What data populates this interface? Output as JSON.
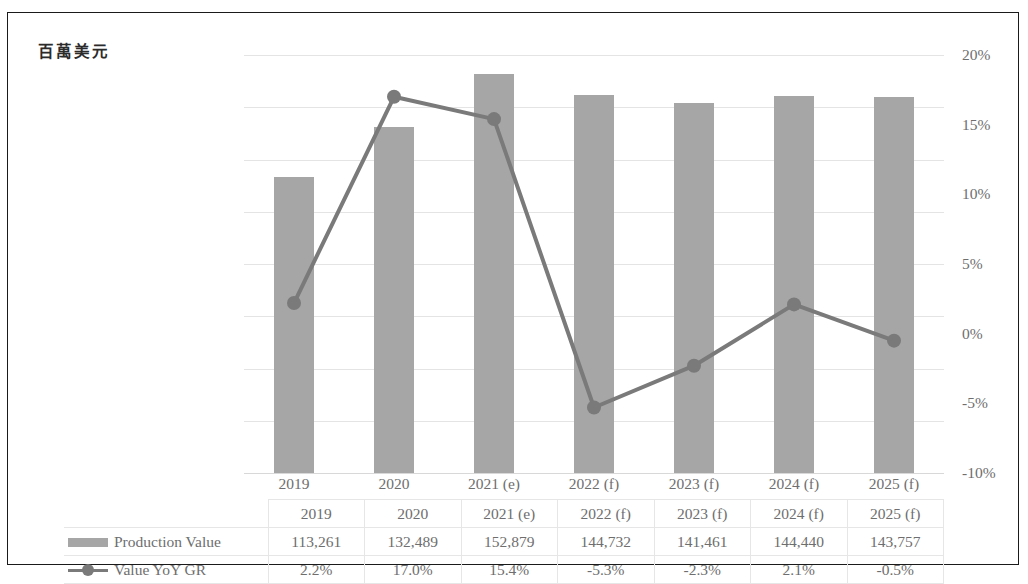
{
  "chart_data": {
    "type": "bar",
    "title": "百萬美元",
    "categories": [
      "2019",
      "2020",
      "2021 (e)",
      "2022 (f)",
      "2023 (f)",
      "2024 (f)",
      "2025 (f)"
    ],
    "series": [
      {
        "name": "Production Value",
        "type": "bar",
        "axis": "left",
        "color": "#a6a6a6",
        "values": [
          113261,
          132489,
          152879,
          144732,
          141461,
          144440,
          143757
        ],
        "labels": [
          "113,261",
          "132,489",
          "152,879",
          "144,732",
          "141,461",
          "144,440",
          "143,757"
        ]
      },
      {
        "name": "Value YoY GR",
        "type": "line",
        "axis": "right",
        "color": "#7a7a7a",
        "values": [
          2.2,
          17.0,
          15.4,
          -5.3,
          -2.3,
          2.1,
          -0.5
        ],
        "labels": [
          "2.2%",
          "17.0%",
          "15.4%",
          "-5.3%",
          "-2.3%",
          "2.1%",
          "-0.5%"
        ]
      }
    ],
    "xlabel": "",
    "ylabel": "百萬美元",
    "ylim": [
      0,
      160000
    ],
    "y2lim": [
      -10,
      20
    ],
    "yticks": [
      160000,
      140000,
      120000,
      100000,
      80000,
      60000,
      40000,
      20000,
      0
    ],
    "ytick_labels": [
      "160,000",
      "140,000",
      "120,000",
      "100,000",
      "80,000",
      "60,000",
      "40,000",
      "20,000",
      "-"
    ],
    "y2ticks": [
      20,
      15,
      10,
      5,
      0,
      -5,
      -10
    ],
    "y2tick_labels": [
      "20%",
      "15%",
      "10%",
      "5%",
      "0%",
      "-5%",
      "-10%"
    ],
    "grid": true,
    "legend_position": "bottom-table"
  },
  "legend": {
    "bar_label": "Production Value",
    "line_label": "Value YoY GR"
  }
}
